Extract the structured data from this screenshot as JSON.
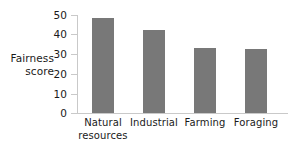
{
  "chart_data": {
    "type": "bar",
    "title": "",
    "xlabel": "",
    "ylabel": "Fairness score",
    "ylabel_lines": [
      "Fairness",
      "score"
    ],
    "categories": [
      "Natural resources",
      "Industrial",
      "Farming",
      "Foraging"
    ],
    "category_lines": [
      [
        "Natural",
        "resources"
      ],
      [
        "Industrial"
      ],
      [
        "Farming"
      ],
      [
        "Foraging"
      ]
    ],
    "values": [
      48.5,
      42.5,
      33,
      32.5
    ],
    "ylim": [
      0,
      50
    ],
    "yticks": [
      0,
      10,
      20,
      30,
      40,
      50
    ],
    "ytick_labels": [
      "0",
      "10",
      "20",
      "30",
      "40",
      "50"
    ],
    "grid": false,
    "legend": null,
    "bar_color": "#787878",
    "axis_color": "#c9c9c9",
    "text_color": "#1a1a1a",
    "background": "#ffffff"
  }
}
